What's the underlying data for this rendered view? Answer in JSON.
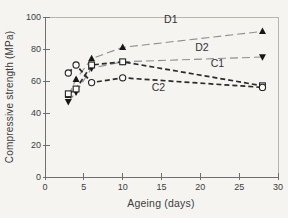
{
  "figure": {
    "background": "#f5f4f1",
    "frame_color": "#b8b5af",
    "axis_color": "#6e6e6e",
    "text_color": "#3c3c3c",
    "marker_fill": "#161616",
    "open_marker_fill": "#fbfaf8"
  },
  "chart_data": {
    "type": "line",
    "title": "",
    "xlabel": "Ageing (days)",
    "ylabel": "Compressive strength (MPa)",
    "xlim": [
      0,
      30
    ],
    "ylim": [
      0,
      100
    ],
    "x_ticks": [
      0,
      5,
      10,
      15,
      20,
      25,
      30
    ],
    "y_ticks": [
      0,
      20,
      40,
      60,
      80,
      100
    ],
    "grid": false,
    "legend_position": "inline-labels",
    "x": [
      3,
      4,
      6,
      10,
      28
    ],
    "series": [
      {
        "name": "D1",
        "values": [
          51,
          61,
          74,
          81,
          91
        ],
        "line_style": "long-dash",
        "line_color": "#8f8f8f",
        "line_width": 1.1,
        "marker": "triangle-up-filled",
        "label_pos": {
          "x": 16.2,
          "y": 96
        }
      },
      {
        "name": "D2",
        "values": [
          47,
          53,
          68,
          72,
          75
        ],
        "line_style": "long-dash",
        "line_color": "#8f8f8f",
        "line_width": 1.1,
        "marker": "triangle-down-filled",
        "label_pos": {
          "x": 20.2,
          "y": 79
        }
      },
      {
        "name": "C1",
        "values": [
          52,
          55,
          70,
          72,
          57
        ],
        "line_style": "dash",
        "line_color": "#2b2b2b",
        "line_width": 1.7,
        "marker": "square-open",
        "label_pos": {
          "x": 22.2,
          "y": 69
        }
      },
      {
        "name": "C2",
        "values": [
          65,
          70,
          59,
          62,
          56
        ],
        "line_style": "dash",
        "line_color": "#2b2b2b",
        "line_width": 1.7,
        "marker": "circle-open",
        "label_pos": {
          "x": 14.6,
          "y": 54
        }
      }
    ]
  }
}
